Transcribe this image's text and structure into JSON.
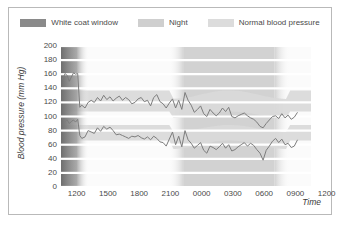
{
  "figure": {
    "legend": [
      {
        "name": "white-coat-window",
        "label": "White coat window",
        "color": "#8a8a8a"
      },
      {
        "name": "night",
        "label": "Night",
        "color": "#cfcfcf"
      },
      {
        "name": "normal-blood-pressure",
        "label": "Normal blood pressure",
        "color": "#dcdcdc"
      }
    ]
  },
  "chart_data": {
    "type": "line",
    "title": "",
    "xlabel": "Time",
    "ylabel": "Blood pressure (mm Hg)",
    "ylim": [
      0,
      200
    ],
    "ytick_step": 20,
    "ytick_labels": [
      "200",
      "180",
      "160",
      "140",
      "120",
      "100",
      "80",
      "60",
      "40",
      "20",
      "0"
    ],
    "xtick_labels": [
      "1200",
      "1500",
      "1800",
      "2100",
      "0000",
      "0300",
      "0600",
      "0900",
      "1200"
    ],
    "xlim_hours": [
      10.5,
      34.5
    ],
    "grid": "horizontal-white-lines",
    "legend_position": "top-center",
    "bands": {
      "white_coat_window": {
        "label": "White coat window",
        "x_start_hour": 10.5,
        "x_end_hour": 13.2,
        "color": "#8a8a8a",
        "note": "dark gradient fading to the right at far left of plot"
      },
      "night": {
        "label": "Night",
        "x_start_hour": 22.3,
        "x_end_hour": 31.0,
        "color": "#cfcfcf",
        "note": "soft-edged vertical shaded region"
      },
      "normal_systolic": {
        "label": "Normal blood pressure (systolic)",
        "day_range": [
          107,
          137
        ],
        "night_range": [
          98,
          125
        ],
        "color": "#dcdcdc"
      },
      "normal_diastolic": {
        "label": "Normal blood pressure (diastolic)",
        "day_range": [
          66,
          88
        ],
        "night_range": [
          54,
          78
        ],
        "color": "#dcdcdc"
      }
    },
    "series": [
      {
        "name": "Systolic",
        "color": "#7d7d7d",
        "x": [
          10.6,
          10.9,
          11.1,
          11.3,
          11.5,
          11.7,
          11.9,
          12.1,
          12.3,
          12.5,
          12.8,
          13.1,
          13.4,
          13.7,
          14.0,
          14.3,
          14.6,
          14.9,
          15.2,
          15.5,
          15.8,
          16.1,
          16.4,
          16.7,
          17.0,
          17.3,
          17.6,
          17.9,
          18.2,
          18.5,
          18.8,
          19.1,
          19.4,
          19.7,
          20.0,
          20.3,
          20.6,
          20.9,
          21.2,
          21.5,
          21.8,
          22.1,
          22.4,
          22.7,
          23.0,
          23.3,
          23.6,
          23.9,
          24.2,
          24.5,
          24.8,
          25.1,
          25.4,
          25.7,
          26.0,
          26.3,
          26.6,
          26.9,
          27.2,
          27.5,
          27.8,
          28.1,
          28.4,
          28.7,
          29.0,
          29.3,
          29.6,
          29.9,
          30.2,
          30.5,
          30.8,
          31.1,
          31.4,
          31.7,
          32.0,
          32.3,
          32.6,
          32.9,
          33.2
        ],
        "values": [
          152,
          161,
          158,
          150,
          156,
          162,
          160,
          161,
          113,
          116,
          112,
          120,
          123,
          120,
          127,
          122,
          130,
          124,
          128,
          122,
          126,
          129,
          123,
          127,
          124,
          118,
          120,
          125,
          127,
          121,
          123,
          115,
          127,
          131,
          121,
          118,
          112,
          119,
          125,
          112,
          123,
          110,
          134,
          123,
          116,
          106,
          110,
          115,
          104,
          100,
          110,
          105,
          101,
          105,
          112,
          107,
          113,
          100,
          98,
          101,
          103,
          105,
          101,
          98,
          96,
          92,
          86,
          84,
          90,
          95,
          100,
          101,
          97,
          104,
          98,
          102,
          96,
          99,
          106
        ]
      },
      {
        "name": "Diastolic",
        "color": "#7d7d7d",
        "x": [
          10.6,
          10.9,
          11.1,
          11.3,
          11.5,
          11.7,
          11.9,
          12.1,
          12.3,
          12.5,
          12.8,
          13.1,
          13.4,
          13.7,
          14.0,
          14.3,
          14.6,
          14.9,
          15.2,
          15.5,
          15.8,
          16.1,
          16.4,
          16.7,
          17.0,
          17.3,
          17.6,
          17.9,
          18.2,
          18.5,
          18.8,
          19.1,
          19.4,
          19.7,
          20.0,
          20.3,
          20.6,
          20.9,
          21.2,
          21.5,
          21.8,
          22.1,
          22.4,
          22.7,
          23.0,
          23.3,
          23.6,
          23.9,
          24.2,
          24.5,
          24.8,
          25.1,
          25.4,
          25.7,
          26.0,
          26.3,
          26.6,
          26.9,
          27.2,
          27.5,
          27.8,
          28.1,
          28.4,
          28.7,
          29.0,
          29.3,
          29.6,
          29.9,
          30.2,
          30.5,
          30.8,
          31.1,
          31.4,
          31.7,
          32.0,
          32.3,
          32.6,
          32.9,
          33.2
        ],
        "values": [
          97,
          93,
          95,
          90,
          93,
          95,
          92,
          96,
          73,
          69,
          71,
          80,
          78,
          76,
          84,
          79,
          86,
          82,
          85,
          80,
          74,
          75,
          73,
          71,
          69,
          72,
          71,
          73,
          70,
          68,
          71,
          67,
          72,
          69,
          64,
          63,
          58,
          68,
          78,
          60,
          72,
          57,
          80,
          67,
          62,
          55,
          59,
          63,
          52,
          48,
          58,
          56,
          53,
          57,
          62,
          55,
          60,
          51,
          53,
          57,
          60,
          63,
          58,
          62,
          59,
          53,
          48,
          38,
          52,
          58,
          65,
          69,
          63,
          68,
          60,
          62,
          56,
          58,
          67
        ]
      }
    ]
  }
}
